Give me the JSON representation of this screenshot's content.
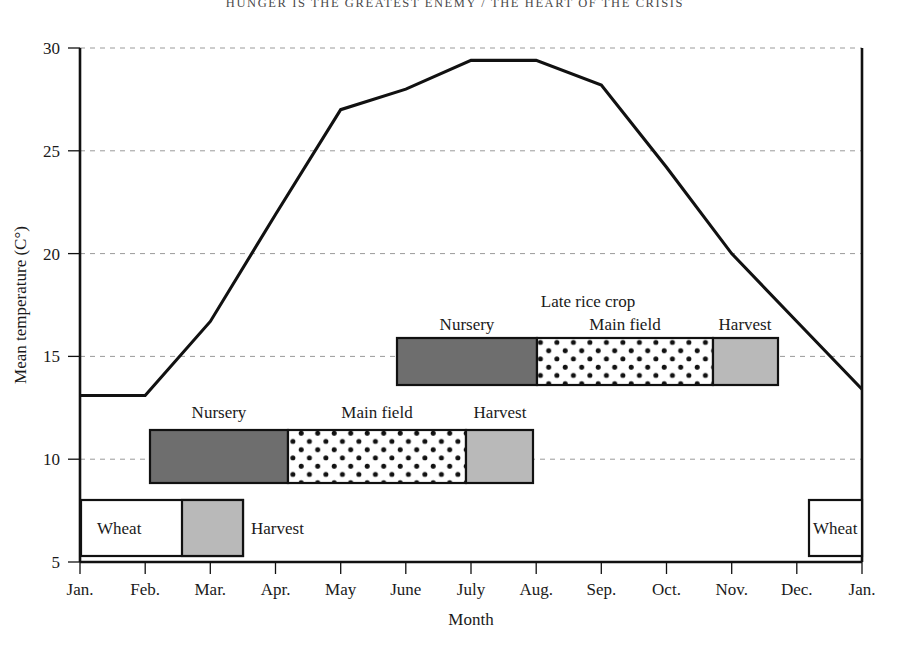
{
  "page": {
    "running_head": "HUNGER IS THE GREATEST ENEMY / THE HEART OF THE CRISIS",
    "folio_left": "",
    "folio_right": ""
  },
  "chart_data": {
    "type": "line",
    "title": "",
    "xlabel": "Month",
    "ylabel": "Mean temperature (C°)",
    "ylim": [
      5,
      30
    ],
    "yticks": [
      5,
      10,
      15,
      20,
      25,
      30
    ],
    "ytick_labels": [
      "5",
      "10",
      "15",
      "20",
      "25",
      "30"
    ],
    "grid": true,
    "legend": "none",
    "categories": [
      "Jan.",
      "Feb.",
      "Mar.",
      "Apr.",
      "May",
      "June",
      "July",
      "Aug.",
      "Sep.",
      "Oct.",
      "Nov.",
      "Dec.",
      "Jan."
    ],
    "series": [
      {
        "name": "Mean temperature",
        "values": [
          13.1,
          13.1,
          16.7,
          21.9,
          27.0,
          28.0,
          29.4,
          29.4,
          28.2,
          24.2,
          20.0,
          16.7,
          13.4
        ]
      }
    ],
    "annotations": {
      "early_rice": {
        "title": "",
        "segments": [
          {
            "label": "Nursery",
            "pattern": "solid-dark",
            "start_month": "Feb.",
            "end_month": "Apr."
          },
          {
            "label": "Main field",
            "pattern": "dotted",
            "start_month": "Apr.",
            "end_month": "July"
          },
          {
            "label": "Harvest",
            "pattern": "solid-light",
            "start_month": "July",
            "end_month": "July"
          }
        ]
      },
      "late_rice": {
        "title": "Late rice crop",
        "segments": [
          {
            "label": "Nursery",
            "pattern": "solid-dark",
            "start_month": "June",
            "end_month": "Aug."
          },
          {
            "label": "Main field",
            "pattern": "dotted",
            "start_month": "Aug.",
            "end_month": "Oct."
          },
          {
            "label": "Harvest",
            "pattern": "solid-light",
            "start_month": "Oct.",
            "end_month": "Nov."
          }
        ]
      },
      "wheat_left": {
        "label": "Wheat",
        "harvest_label": "Harvest",
        "start_month": "Jan.",
        "end_month": "Mar."
      },
      "wheat_right": {
        "label": "Wheat",
        "start_month": "Dec.",
        "end_month": "Jan."
      }
    }
  },
  "colors": {
    "nursery": "#6e6e6e",
    "harvest": "#b9b9b9",
    "main_field": "#ffffff",
    "line": "#111111",
    "grid": "#9a9a9a"
  }
}
